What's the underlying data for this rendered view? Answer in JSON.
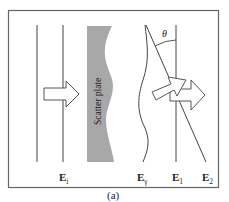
{
  "figure": {
    "caption": "(a)",
    "plate_label": "Scatter plate",
    "angle_label": "θ",
    "fields": [
      {
        "id": "incident",
        "symbol": "E",
        "subscript": "i"
      },
      {
        "id": "scattered",
        "symbol": "E",
        "subscript": "γ"
      },
      {
        "id": "beam1",
        "symbol": "E",
        "subscript": "1"
      },
      {
        "id": "beam2",
        "symbol": "E",
        "subscript": "2"
      }
    ],
    "colors": {
      "plate": "#a8a8a8",
      "lines": "#444444",
      "border": "#555555",
      "background": "#ffffff"
    }
  }
}
